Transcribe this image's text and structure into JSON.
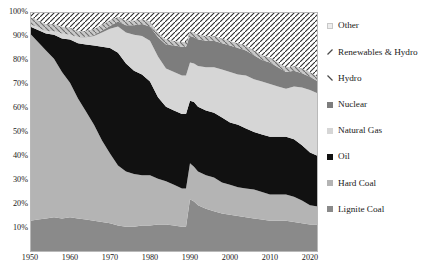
{
  "chart_data": {
    "type": "area",
    "title": "",
    "xlabel": "",
    "ylabel": "",
    "stacked": true,
    "stack_normalized": true,
    "grid": false,
    "legend_position": "right",
    "xlim": [
      1950,
      2022
    ],
    "ylim": [
      0,
      100
    ],
    "x_ticks": [
      "1950",
      "1960",
      "1970",
      "1980",
      "1990",
      "2000",
      "2010",
      "2020"
    ],
    "x_tick_values": [
      1950,
      1960,
      1970,
      1980,
      1990,
      2000,
      2010,
      2020
    ],
    "y_ticks": [
      "10%",
      "20%",
      "30%",
      "40%",
      "50%",
      "60%",
      "70%",
      "80%",
      "90%",
      "100%"
    ],
    "y_tick_values": [
      10,
      20,
      30,
      40,
      50,
      60,
      70,
      80,
      90,
      100
    ],
    "x": [
      1950,
      1952,
      1954,
      1956,
      1958,
      1960,
      1962,
      1964,
      1966,
      1968,
      1970,
      1972,
      1974,
      1976,
      1978,
      1980,
      1982,
      1984,
      1986,
      1988,
      1989,
      1990,
      1991,
      1992,
      1994,
      1996,
      1998,
      2000,
      2002,
      2004,
      2006,
      2008,
      2010,
      2012,
      2014,
      2016,
      2018,
      2020,
      2022
    ],
    "series": [
      {
        "name": "Lignite Coal",
        "color": "#8a8a8a",
        "order": 1,
        "values": [
          13,
          13.5,
          14,
          14.5,
          14,
          14.5,
          14,
          13.5,
          13,
          12.5,
          12,
          11,
          10.5,
          10.5,
          11,
          11,
          11.5,
          11.5,
          11,
          10.5,
          10.5,
          22,
          21,
          19.5,
          18,
          17,
          16,
          15.5,
          15,
          14.5,
          14,
          13.5,
          13,
          13,
          13,
          12.5,
          12,
          11.5,
          11.5
        ]
      },
      {
        "name": "Hard Coal",
        "color": "#b4b4b4",
        "order": 2,
        "values": [
          78,
          74,
          70,
          66,
          61,
          56,
          50,
          45,
          40,
          34,
          29,
          25,
          23,
          22,
          21,
          21,
          19,
          18,
          17,
          16,
          16,
          15,
          14.5,
          14,
          14,
          14,
          13,
          12.5,
          12,
          12,
          12,
          11.5,
          11,
          11,
          11,
          10.5,
          9.5,
          8,
          7.5
        ]
      },
      {
        "name": "Oil",
        "color": "#111111",
        "order": 3,
        "values": [
          3,
          5,
          7,
          10,
          14,
          18,
          23,
          28,
          33,
          39,
          44,
          47,
          45,
          43,
          42,
          39,
          34,
          31,
          31,
          31,
          31,
          26,
          27,
          27,
          27,
          27,
          27,
          26,
          26,
          25,
          24,
          24,
          24,
          24,
          24,
          24,
          23,
          22,
          21
        ]
      },
      {
        "name": "Natural Gas",
        "color": "#d6d6d6",
        "order": 4,
        "values": [
          1,
          1,
          1,
          1.5,
          2,
          2,
          2.5,
          3,
          4,
          6,
          8,
          11,
          13,
          15,
          16,
          17,
          17,
          16,
          16,
          16,
          16,
          16,
          16,
          17,
          18,
          19,
          20,
          21,
          21,
          22,
          22,
          22,
          22,
          21,
          20,
          22,
          24,
          26,
          26
        ]
      },
      {
        "name": "Nuclear",
        "color": "#7d7d7d",
        "order": 5,
        "values": [
          0,
          0,
          0,
          0,
          0,
          0,
          0,
          0.2,
          0.4,
          0.8,
          1.2,
          2,
          3,
          4,
          5,
          6,
          8,
          10,
          11,
          12,
          12,
          11,
          11,
          11,
          11,
          11,
          11,
          11,
          11,
          10.5,
          10,
          9,
          9,
          8,
          7,
          6.5,
          6,
          5.5,
          5
        ]
      },
      {
        "name": "Hydro",
        "color": "#c4c4c4",
        "order": 6,
        "hatch": "backslash",
        "values": [
          3,
          3,
          3,
          3,
          3,
          3,
          2.5,
          2.5,
          2.5,
          2.5,
          2.5,
          2,
          2,
          2,
          2,
          2,
          2,
          2,
          2,
          2,
          2,
          2,
          2,
          2,
          2,
          2,
          2,
          2,
          2,
          2,
          2,
          2,
          2,
          2,
          2,
          2,
          2,
          2,
          2
        ]
      },
      {
        "name": "Renewables & Hydro",
        "color": "#ffffff",
        "order": 7,
        "hatch": "slash",
        "values": [
          2,
          3,
          5,
          5,
          6,
          6.5,
          8,
          7.5,
          7,
          5,
          3,
          2,
          3.5,
          3.5,
          3,
          4,
          8.5,
          11,
          12,
          12.5,
          12.5,
          8,
          8.5,
          9.5,
          10,
          10,
          11,
          12,
          13,
          14,
          16,
          18,
          19,
          21,
          23,
          22.5,
          23.5,
          25,
          27
        ]
      },
      {
        "name": "Other",
        "color": "#ededed",
        "order": 8,
        "values": [
          0,
          0.5,
          0,
          0,
          0,
          0,
          0,
          0,
          0.1,
          0.2,
          0.3,
          0,
          0,
          0,
          0,
          0,
          0,
          0,
          0,
          0,
          0,
          0,
          0,
          0,
          0,
          0,
          0,
          0,
          0,
          0,
          0,
          0,
          0,
          0,
          0,
          0,
          0,
          0,
          0
        ]
      }
    ]
  },
  "legend": {
    "items": [
      {
        "label": "Other",
        "marker": "square",
        "color": "#ededed"
      },
      {
        "label": "Renewables & Hydro",
        "marker": "slash",
        "color": "#4a4a4a"
      },
      {
        "label": "Hydro",
        "marker": "backslash",
        "color": "#4a4a4a"
      },
      {
        "label": "Nuclear",
        "marker": "square",
        "color": "#7d7d7d"
      },
      {
        "label": "Natural Gas",
        "marker": "square",
        "color": "#d6d6d6"
      },
      {
        "label": "Oil",
        "marker": "square",
        "color": "#111111"
      },
      {
        "label": "Hard Coal",
        "marker": "square",
        "color": "#b4b4b4"
      },
      {
        "label": "Lignite Coal",
        "marker": "square",
        "color": "#8a8a8a"
      }
    ]
  }
}
